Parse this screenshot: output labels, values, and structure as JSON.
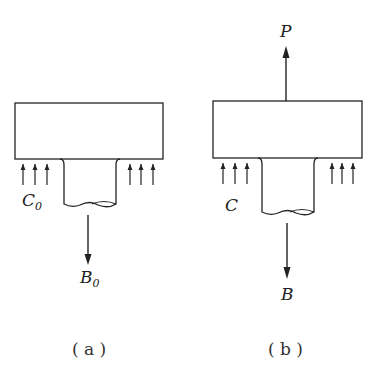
{
  "figures": [
    {
      "id": "a",
      "caption": "( a )",
      "pressure_label": "C",
      "pressure_sub": "0",
      "force_label": "B",
      "force_sub": "0"
    },
    {
      "id": "b",
      "caption": "( b )",
      "pressure_label": "C",
      "top_force_label": "P",
      "force_label": "B"
    }
  ],
  "colors": {
    "stroke": "#222222",
    "background": "#ffffff"
  }
}
